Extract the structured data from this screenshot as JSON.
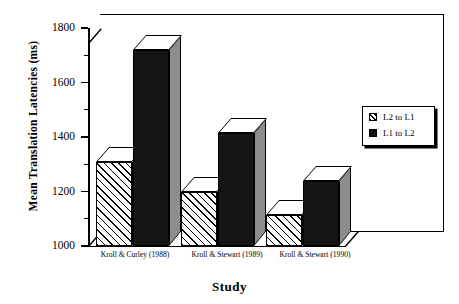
{
  "chart_data": {
    "type": "bar",
    "title": "",
    "xlabel": "Study",
    "ylabel": "Mean Translation Latencies (ms)",
    "ylim": [
      1000,
      1800
    ],
    "ytick_labels": [
      "1000",
      "1200",
      "1400",
      "1600",
      "1800"
    ],
    "ytick_values": [
      1000,
      1200,
      1400,
      1600,
      1800
    ],
    "minor_tick_values": [
      1100,
      1300,
      1500,
      1700
    ],
    "grid": false,
    "legend_position": "right",
    "style": "3d-bar",
    "categories": [
      "Kroll & Curley (1988)",
      "Kroll & Stewart (1989)",
      "Kroll & Stewart (1990)"
    ],
    "series": [
      {
        "name": "L2 to L1",
        "fill": "hatched",
        "values": [
          1310,
          1200,
          1115
        ]
      },
      {
        "name": "L1 to L2",
        "fill": "solid-black",
        "values": [
          1720,
          1415,
          1240
        ]
      }
    ]
  },
  "legend": {
    "items": [
      {
        "label": "L2 to L1",
        "swatch": "hatched-square-icon"
      },
      {
        "label": "L1 to L2",
        "swatch": "solid-square-icon"
      }
    ]
  },
  "axes": {
    "y_title": "Mean Translation Latencies (ms)",
    "x_title": "Study",
    "y_labels": [
      "1800",
      "1600",
      "1400",
      "1200",
      "1000"
    ],
    "x_labels": [
      "Kroll & Curley (1988)",
      "Kroll & Stewart (1989)",
      "Kroll & Stewart (1990)"
    ]
  },
  "colors": {
    "series_l1_to_l2": "#151515",
    "series_l1_to_l2_side": "#8d8d8d",
    "series_l2_to_l1": "#ffffff",
    "axis": "#000000",
    "background": "#ffffff"
  }
}
